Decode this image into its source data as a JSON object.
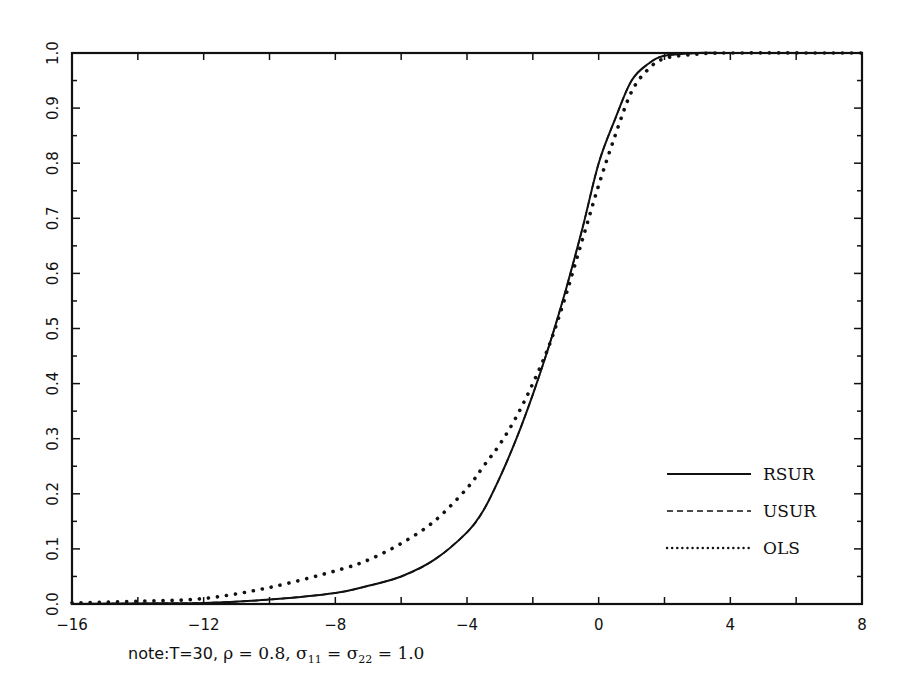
{
  "chart_data": {
    "type": "line",
    "title": "",
    "xlabel": "",
    "ylabel": "",
    "xlim": [
      -16,
      8
    ],
    "ylim": [
      0.0,
      1.0
    ],
    "grid": false,
    "legend_position": "lower right (inside)",
    "x_ticks": [
      -16,
      -12,
      -8,
      -4,
      0,
      4,
      8
    ],
    "x_tick_labels": [
      "−16",
      "−12",
      "−8",
      "−4",
      "0",
      "4",
      "8"
    ],
    "y_ticks": [
      0.0,
      0.1,
      0.2,
      0.3,
      0.4,
      0.5,
      0.6,
      0.7,
      0.8,
      0.9,
      1.0
    ],
    "y_tick_labels": [
      "0.0",
      "0.1",
      "0.2",
      "0.3",
      "0.4",
      "0.5",
      "0.6",
      "0.7",
      "0.8",
      "0.9",
      "1.0"
    ],
    "series": [
      {
        "name": "RSUR",
        "style": "solid",
        "x": [
          -16,
          -14,
          -12,
          -10,
          -8,
          -7,
          -6,
          -5,
          -4,
          -3.5,
          -3,
          -2.5,
          -2,
          -1.5,
          -1,
          -0.5,
          0,
          0.5,
          1,
          1.5,
          2,
          3,
          4,
          8
        ],
        "y": [
          0.0,
          0.001,
          0.002,
          0.008,
          0.02,
          0.033,
          0.05,
          0.08,
          0.13,
          0.17,
          0.23,
          0.3,
          0.38,
          0.47,
          0.57,
          0.68,
          0.8,
          0.88,
          0.95,
          0.98,
          0.995,
          1.0,
          1.0,
          1.0
        ]
      },
      {
        "name": "USUR",
        "style": "dashed",
        "x": [
          -16,
          -14,
          -12,
          -10,
          -8,
          -7,
          -6,
          -5,
          -4,
          -3.5,
          -3,
          -2.5,
          -2,
          -1.5,
          -1,
          -0.5,
          0,
          0.5,
          1,
          1.5,
          2,
          3,
          4,
          8
        ],
        "y": [
          0.0,
          0.001,
          0.002,
          0.008,
          0.02,
          0.033,
          0.05,
          0.08,
          0.13,
          0.17,
          0.23,
          0.3,
          0.38,
          0.47,
          0.57,
          0.68,
          0.8,
          0.88,
          0.95,
          0.98,
          0.995,
          1.0,
          1.0,
          1.0
        ]
      },
      {
        "name": "OLS",
        "style": "dotted",
        "x": [
          -16,
          -14,
          -12,
          -10,
          -8,
          -7,
          -6,
          -5,
          -4,
          -3.5,
          -3,
          -2.5,
          -2,
          -1.5,
          -1,
          -0.5,
          0,
          0.5,
          1,
          1.5,
          2,
          3,
          4,
          8
        ],
        "y": [
          0.002,
          0.005,
          0.01,
          0.03,
          0.06,
          0.08,
          0.11,
          0.15,
          0.21,
          0.25,
          0.29,
          0.34,
          0.4,
          0.47,
          0.56,
          0.66,
          0.76,
          0.85,
          0.93,
          0.97,
          0.99,
          0.998,
          1.0,
          1.0
        ]
      }
    ],
    "legend": [
      "RSUR",
      "USUR",
      "OLS"
    ],
    "annotation": "note:T=30, ρ = 0.8, σ11 = σ22 = 1.0"
  },
  "note": {
    "prefix": "note:T=30, ",
    "rho": "ρ = 0.8, ",
    "sigma11": "σ",
    "sub11": "11",
    "eq": " = ",
    "sigma22": "σ",
    "sub22": "22",
    "value": " = 1.0"
  },
  "colors": {
    "ink": "#111111",
    "background": "#ffffff"
  }
}
